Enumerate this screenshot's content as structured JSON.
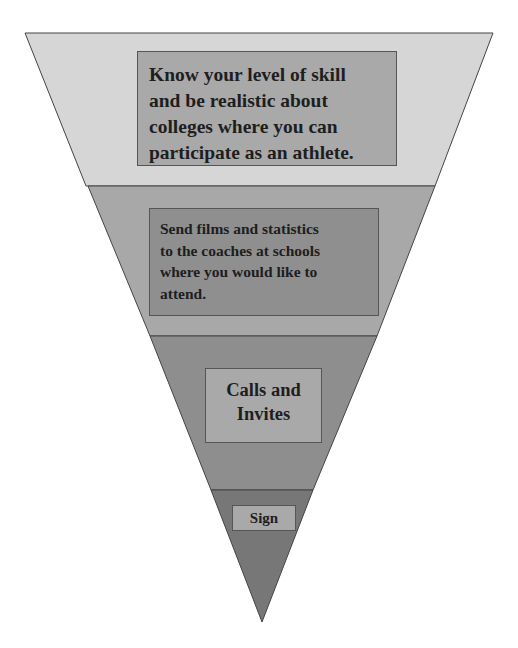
{
  "diagram": {
    "type": "inverted-funnel",
    "levels": [
      {
        "label": "Know your level of skill and be realistic about colleges where you can participate as an athlete.",
        "lines": [
          "Know your level of skill",
          "and be realistic about",
          "colleges where you can",
          "participate as an athlete."
        ],
        "band_color": "#d6d6d6",
        "box_color": "#a9a9a9"
      },
      {
        "label": "Send films and statistics to the coaches at schools where you would like to attend.",
        "lines": [
          "Send films and statistics",
          "to the coaches at schools",
          "where you would like to",
          "attend."
        ],
        "band_color": "#a8a8a8",
        "box_color": "#8f8f8f"
      },
      {
        "label": "Calls and Invites",
        "lines": [
          "Calls and",
          "Invites"
        ],
        "band_color": "#8e8e8e",
        "box_color": "#a9a9a9"
      },
      {
        "label": "Sign",
        "lines": [
          "Sign"
        ],
        "band_color": "#777777",
        "box_color": "#a9a9a9"
      }
    ]
  }
}
